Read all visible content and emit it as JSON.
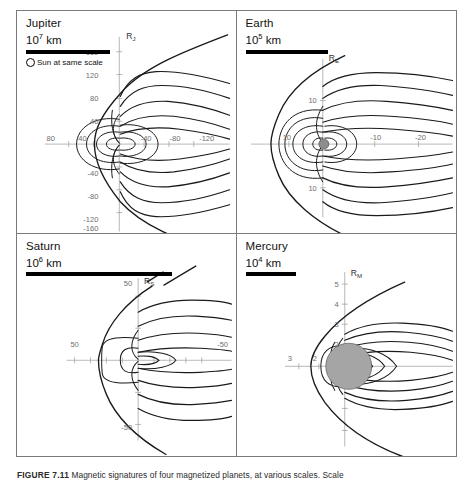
{
  "figure": {
    "caption_label": "FIGURE 7.11",
    "caption_text": "Magnetic signatures of four magnetized planets, at various scales. Scale",
    "caption_full": "FIGURE 7.11   Magnetic signatures of four magnetized planets, at various scales. Scale"
  },
  "panels": [
    {
      "id": "jupiter",
      "planet": "Jupiter",
      "scale_mantissa": "10",
      "scale_exponent": "7",
      "scale_unit": "km",
      "sun_reference": "Sun at same scale",
      "has_sun_reference": true,
      "axis_label": "R",
      "axis_label_sub": "J",
      "vertical_ticks": [
        "160",
        "120",
        "80",
        "40",
        "-40",
        "-80",
        "-120",
        "-160"
      ],
      "horizontal_ticks_sunward": [
        "80",
        "40"
      ],
      "horizontal_ticks_tailward": [
        "-40",
        "-80",
        "-120"
      ]
    },
    {
      "id": "earth",
      "planet": "Earth",
      "scale_mantissa": "10",
      "scale_exponent": "5",
      "scale_unit": "km",
      "sun_reference": "",
      "has_sun_reference": false,
      "axis_label": "R",
      "axis_label_sub": "E",
      "vertical_ticks": [
        "10",
        "10"
      ],
      "horizontal_ticks_sunward": [
        "10"
      ],
      "horizontal_ticks_tailward": [
        "-10",
        "-20"
      ]
    },
    {
      "id": "saturn",
      "planet": "Saturn",
      "scale_mantissa": "10",
      "scale_exponent": "6",
      "scale_unit": "km",
      "sun_reference": "",
      "has_sun_reference": false,
      "axis_label": "R",
      "axis_label_sub": "S",
      "vertical_ticks": [
        "50",
        "-50"
      ],
      "horizontal_ticks_sunward": [
        "50"
      ],
      "horizontal_ticks_tailward": [
        "-50"
      ]
    },
    {
      "id": "mercury",
      "planet": "Mercury",
      "scale_mantissa": "10",
      "scale_exponent": "4",
      "scale_unit": "km",
      "sun_reference": "",
      "has_sun_reference": false,
      "axis_label": "R",
      "axis_label_sub": "M",
      "vertical_ticks": [
        "5",
        "4",
        "3",
        "2"
      ],
      "horizontal_ticks_sunward": [
        "3",
        "2"
      ],
      "horizontal_ticks_tailward": []
    }
  ],
  "colors": {
    "line": "#1a1a1a",
    "axis": "#9a9a9a",
    "border": "#7a7a7a",
    "planet_disk": "#9b9b9b",
    "background": "#ffffff"
  }
}
